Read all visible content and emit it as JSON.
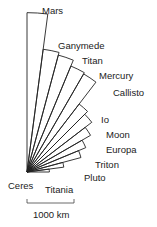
{
  "diagram": {
    "type": "radial-wedge-size-comparison",
    "focal_point": [
      27,
      172
    ],
    "px_per_km": 0.047,
    "stroke_color": "#222222",
    "background": "#ffffff",
    "start_angle_deg": 0,
    "end_angle_deg": 90,
    "bodies": [
      {
        "name": "Mars",
        "radius_km": 3390
      },
      {
        "name": "Ganymede",
        "radius_km": 2634
      },
      {
        "name": "Titan",
        "radius_km": 2575
      },
      {
        "name": "Mercury",
        "radius_km": 2440
      },
      {
        "name": "Callisto",
        "radius_km": 2410
      },
      {
        "name": "Io",
        "radius_km": 1822
      },
      {
        "name": "Moon",
        "radius_km": 1737
      },
      {
        "name": "Europa",
        "radius_km": 1561
      },
      {
        "name": "Triton",
        "radius_km": 1353
      },
      {
        "name": "Pluto",
        "radius_km": 1188
      },
      {
        "name": "Titania",
        "radius_km": 789
      },
      {
        "name": "Ceres",
        "radius_km": 476
      }
    ],
    "labels": [
      {
        "text": "Mars",
        "x": 42,
        "y": 14
      },
      {
        "text": "Ganymede",
        "x": 58,
        "y": 49
      },
      {
        "text": "Titan",
        "x": 82,
        "y": 64
      },
      {
        "text": "Mercury",
        "x": 99,
        "y": 79
      },
      {
        "text": "Callisto",
        "x": 113,
        "y": 96
      },
      {
        "text": "Io",
        "x": 101,
        "y": 123
      },
      {
        "text": "Moon",
        "x": 106,
        "y": 138
      },
      {
        "text": "Europa",
        "x": 106,
        "y": 153
      },
      {
        "text": "Triton",
        "x": 95,
        "y": 168
      },
      {
        "text": "Pluto",
        "x": 84,
        "y": 181
      },
      {
        "text": "Titania",
        "x": 45,
        "y": 193
      },
      {
        "text": "Ceres",
        "x": 8,
        "y": 189
      }
    ]
  },
  "scale_bar": {
    "label": "1000 km",
    "x1": 27,
    "x2": 74,
    "y": 203
  }
}
